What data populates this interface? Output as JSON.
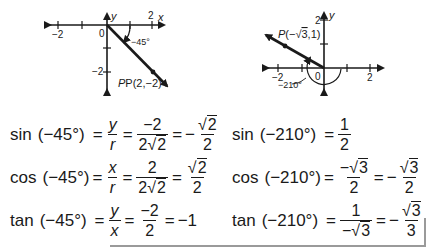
{
  "graph_left": {
    "axis_labels": {
      "x": "x",
      "y": "y",
      "origin": "0"
    },
    "tick_labels": {
      "x_neg2": "−2",
      "x_pos2": "2",
      "y_neg2": "−2"
    },
    "angle_label": "−45°",
    "point_label": "P(2,−2)"
  },
  "graph_right": {
    "axis_labels": {
      "y": "y",
      "origin": "0"
    },
    "tick_labels": {
      "x_neg2": "−2",
      "x_pos2": "2",
      "y_pos2": "2"
    },
    "angle_label": "−210°",
    "point_label_prefix": "P(−",
    "point_label_radicand": "3",
    "point_label_suffix": ",1)"
  },
  "equations_left": [
    {
      "fn": "sin",
      "arg": "(−45°)",
      "step1": {
        "num": "y",
        "den": "r"
      },
      "step2": {
        "num": "−2",
        "den_coef": "2",
        "den_rad": "2"
      },
      "result_sign": "−",
      "result": {
        "num_rad": "2",
        "den": "2"
      }
    },
    {
      "fn": "cos",
      "arg": "(−45°)",
      "step1": {
        "num": "x",
        "den": "r"
      },
      "step2": {
        "num": "2",
        "den_coef": "2",
        "den_rad": "2"
      },
      "result_sign": "",
      "result": {
        "num_rad": "2",
        "den": "2"
      }
    },
    {
      "fn": "tan",
      "arg": "(−45°)",
      "step1": {
        "num": "y",
        "den": "x"
      },
      "step2": {
        "num": "−2",
        "den": "2"
      },
      "result": "−1"
    }
  ],
  "equations_right": [
    {
      "fn": "sin",
      "arg": "(−210°)",
      "result": {
        "num": "1",
        "den": "2"
      }
    },
    {
      "fn": "cos",
      "arg": "(−210°)",
      "step1": {
        "num_sign": "−",
        "num_rad": "3",
        "den": "2"
      },
      "result_sign": "−",
      "result": {
        "num_rad": "3",
        "den": "2"
      }
    },
    {
      "fn": "tan",
      "arg": "(−210°)",
      "step1": {
        "num": "1",
        "den_sign": "−",
        "den_rad": "3"
      },
      "result_sign": "−",
      "result": {
        "num_rad": "3",
        "den": "3"
      }
    }
  ],
  "symbols": {
    "eq": "=",
    "radical": "√"
  }
}
